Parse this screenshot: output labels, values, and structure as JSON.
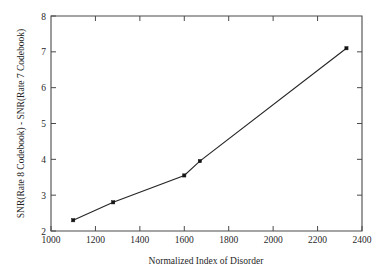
{
  "chart_data": {
    "type": "line",
    "title": "",
    "subtitle": "",
    "xlabel": "Normalized Index of Disorder",
    "ylabel": "SNR(Rate 8 Codebook) - SNR(Rate 7 Codebook)",
    "xlim": [
      1000,
      2400
    ],
    "ylim": [
      2,
      8
    ],
    "xticks": [
      1000,
      1200,
      1400,
      1600,
      1800,
      2000,
      2200,
      2400
    ],
    "yticks": [
      2,
      3,
      4,
      5,
      6,
      7,
      8
    ],
    "xtick_labels": [
      "1000",
      "1200",
      "1400",
      "1600",
      "1800",
      "2000",
      "2200",
      "2400"
    ],
    "ytick_labels": [
      "2",
      "3",
      "4",
      "5",
      "6",
      "7",
      "8"
    ],
    "grid": false,
    "legend": null,
    "legend_position": "none",
    "marker": "square",
    "series": [
      {
        "name": "SNR gain vs index of disorder",
        "x": [
          1100,
          1280,
          1600,
          1670,
          2330
        ],
        "y": [
          2.3,
          2.8,
          3.55,
          3.95,
          7.1
        ],
        "points": [
          {
            "x": 1100,
            "y": 2.3
          },
          {
            "x": 1280,
            "y": 2.8
          },
          {
            "x": 1600,
            "y": 3.55
          },
          {
            "x": 1670,
            "y": 3.95
          },
          {
            "x": 2330,
            "y": 7.1
          }
        ]
      }
    ],
    "annotations": []
  },
  "axes": {
    "x_title": "Normalized Index of Disorder",
    "y_title": "SNR(Rate 8 Codebook) - SNR(Rate 7 Codebook)",
    "x_labels": [
      "1000",
      "1200",
      "1400",
      "1600",
      "1800",
      "2000",
      "2200",
      "2400"
    ],
    "y_labels": [
      "2",
      "3",
      "4",
      "5",
      "6",
      "7",
      "8"
    ]
  },
  "style": {
    "axis_color": "#4a4a4a",
    "line_color": "#262626",
    "marker_color": "#141414",
    "text_color": "#1f1f1f",
    "background": "#ffffff"
  }
}
